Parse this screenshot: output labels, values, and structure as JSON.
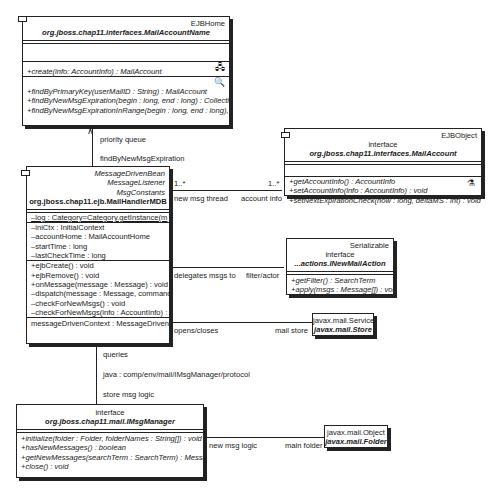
{
  "mail_account_home": {
    "stereotype": "EJBHome",
    "name": "org.jboss.chap11.interfaces.MailAccountName",
    "create_methods": [
      "+create(info: AccountInfo) : MailAccount"
    ],
    "finder_methods": [
      "+findByPrimaryKey(userMailID : String) : MailAccount",
      "+findByNewMsgExpiration(begin : long, end : long) : Collection",
      "+findByNewMsgExpirationInRange(begin : long, end : long), start"
    ],
    "create_icon": "home-create-icon",
    "finder_icon": "finder-magnifier-icon"
  },
  "mail_account": {
    "stereotype": "EJBObject",
    "kind": "interface",
    "name": "org.jboss.chap11.interfaces.MailAccount",
    "methods": [
      "+getAccountInfo() : AccountInfo",
      "+setAccountInfo(info : AccountInfo) : void",
      "+setNextExpirationCheck(now : long, deltaMS : int) : void"
    ],
    "icon": "business-method-icon"
  },
  "mail_handler": {
    "stereotypes": [
      "MessageDrivenBean",
      "MessageListener",
      "MsgConstants"
    ],
    "name": "org.jboss.chap11.ejb.MailHandlerMDB",
    "static_attributes": [
      "–log : Category=Category.getInstance(m"
    ],
    "attributes": [
      "–iniCtx : InitialContext",
      "–accountHome : MailAccountHome",
      "–startTime : long",
      "–lastCheckTime : long"
    ],
    "methods": [
      "+ejbCreate() : void",
      "+ejbRemove() : void",
      "+onMessage(message : Message) : void",
      "–dispatch(message : Message, command : St",
      "–checkForNewMsgs() : void",
      "–checkForNewMsgs(info : AccountInfo) : v"
    ],
    "context": "messageDrivenContext : MessageDrivenC"
  },
  "new_mail_action": {
    "stereotype": "Serializable",
    "kind": "interface",
    "name": "...actions.INewMailAction",
    "methods": [
      "+getFilter() : SearchTerm",
      "+apply(msgs : Message[]) : void"
    ]
  },
  "store": {
    "stereotype": "javax.mail.Service",
    "name": "javax.mail.Store"
  },
  "msg_manager": {
    "kind": "interface",
    "name": "org.jboss.chap11.mail.IMsgManager",
    "methods": [
      "+initialize(folder : Folder, folderNames : String[]) : void",
      "+hasNewMessages() : boolean",
      "+getNewMessages(searchTerm : SearchTerm) : Message[]",
      "+close() : void"
    ]
  },
  "folder": {
    "stereotype": "javax.mail.Object",
    "name": "javax.mail.Folder"
  },
  "associations": {
    "home_link": {
      "role_upper": "priority queue",
      "role_lower": "findByNewMsgExpiration"
    },
    "account_link": {
      "mult_left": "1..*",
      "mult_right": "1..*",
      "role_left": "new msg thread",
      "role_right": "account info"
    },
    "action_link": {
      "role_left": "delegates msgs to",
      "role_right": "filter/actor"
    },
    "store_link": {
      "role_left": "opens/closes",
      "role_right": "mail store"
    },
    "manager_link": {
      "role_upper": "queries",
      "jndi": "java : comp/env/mail/IMsgManager/protocol",
      "role_lower": "store msg logic"
    },
    "folder_link": {
      "role_left": "new msg logic",
      "role_right": "main folder"
    }
  }
}
